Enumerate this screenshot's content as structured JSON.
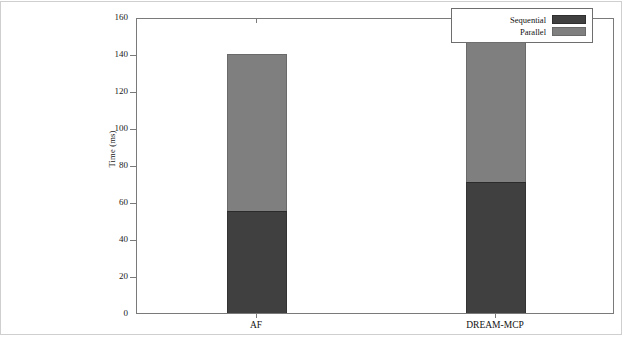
{
  "chart_data": {
    "type": "bar",
    "subtype": "stacked-vertical",
    "title": "",
    "xlabel": "",
    "ylabel": "Time (ms)",
    "ylim": [
      0,
      160
    ],
    "ytick_step": 20,
    "yticks": [
      0,
      20,
      40,
      60,
      80,
      100,
      120,
      140,
      160
    ],
    "ytick_labels": [
      "0",
      "20",
      "40",
      "60",
      "80",
      "100",
      "120",
      "140",
      "160"
    ],
    "grid": false,
    "categories": [
      "AF",
      "DREAM-MCP"
    ],
    "series": [
      {
        "name": "Sequential",
        "color": "#404040",
        "values": [
          55,
          71
        ]
      },
      {
        "name": "Parallel",
        "color": "#7f7f7f",
        "values": [
          85,
          84
        ]
      }
    ],
    "totals": [
      140,
      155
    ],
    "legend": {
      "position": "top-right",
      "entries": [
        {
          "label": "Sequential",
          "color": "#404040"
        },
        {
          "label": "Parallel",
          "color": "#7f7f7f"
        }
      ]
    },
    "axis_color": "#7a7a7a",
    "background": "#ffffff"
  }
}
